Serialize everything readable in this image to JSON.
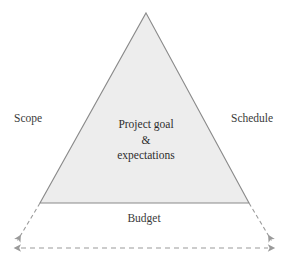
{
  "diagram": {
    "name": "project-management-triangle",
    "background_color": "#ffffff",
    "triangle": {
      "fill_color": "#ededed",
      "stroke_color": "#8a8a8a",
      "apex": {
        "x": 146,
        "y": 13
      },
      "base_left": {
        "x": 40,
        "y": 203
      },
      "base_right": {
        "x": 249,
        "y": 203
      }
    },
    "center_text": {
      "line1": "Project goal",
      "line2": "&",
      "line3": "expectations",
      "color": "#2d2d2d"
    },
    "side_labels": {
      "left": "Scope",
      "right": "Schedule",
      "bottom": "Budget",
      "color": "#3a3a3a"
    },
    "connectors": {
      "color": "#9a9a9a",
      "style": "dashed",
      "left_leader": {
        "x1": 40,
        "y1": 203,
        "x2": 16,
        "y2": 243
      },
      "right_leader": {
        "x1": 249,
        "y1": 203,
        "x2": 273,
        "y2": 243
      },
      "span_arrow": {
        "x1": 15,
        "y1": 248,
        "x2": 274,
        "y2": 248,
        "heads": "both"
      }
    }
  }
}
